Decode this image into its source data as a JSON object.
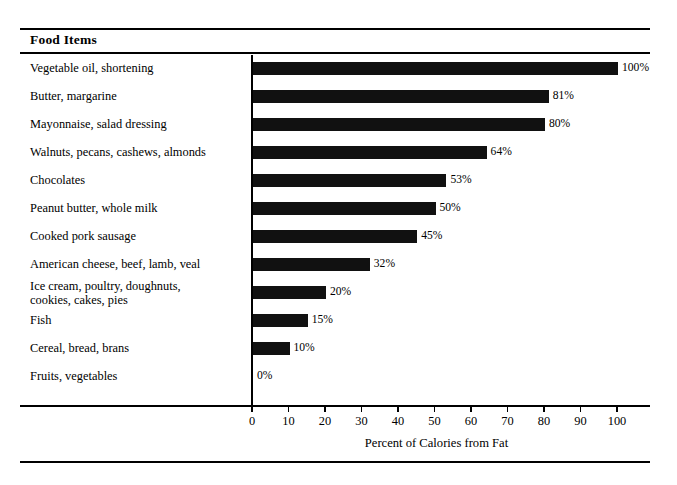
{
  "header": {
    "title": "Food Items"
  },
  "axis": {
    "x_title": "Percent of Calories from Fat",
    "ticks": [
      "0",
      "10",
      "20",
      "30",
      "40",
      "50",
      "60",
      "70",
      "80",
      "90",
      "100"
    ]
  },
  "colors": {
    "bar": "#111111",
    "rule": "#000000",
    "background": "#ffffff",
    "text": "#000000"
  },
  "chart_data": {
    "type": "bar",
    "orientation": "horizontal",
    "title": "Food Items",
    "xlabel": "Percent of Calories from Fat",
    "ylabel": "",
    "xlim": [
      0,
      100
    ],
    "xticks": [
      0,
      10,
      20,
      30,
      40,
      50,
      60,
      70,
      80,
      90,
      100
    ],
    "grid": false,
    "legend": null,
    "categories": [
      "Vegetable oil, shortening",
      "Butter, margarine",
      "Mayonnaise, salad dressing",
      "Walnuts, pecans, cashews, almonds",
      "Chocolates",
      "Peanut butter, whole milk",
      "Cooked pork sausage",
      "American cheese, beef, lamb, veal",
      "Ice cream, poultry, doughnuts,\ncookies, cakes, pies",
      "Fish",
      "Cereal, bread, brans",
      "Fruits, vegetables"
    ],
    "values": [
      100,
      81,
      80,
      64,
      53,
      50,
      45,
      32,
      20,
      15,
      10,
      0
    ],
    "data_labels": [
      "100%",
      "81%",
      "80%",
      "64%",
      "53%",
      "50%",
      "45%",
      "32%",
      "20%",
      "15%",
      "10%",
      "0%"
    ]
  }
}
